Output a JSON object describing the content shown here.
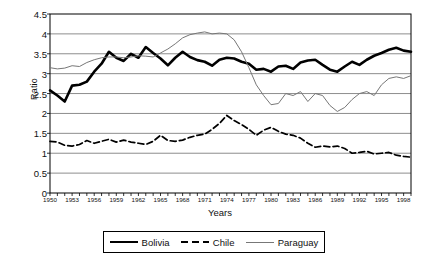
{
  "chart_data": {
    "type": "line",
    "title": "",
    "xlabel": "Years",
    "ylabel": "Ratio",
    "ylim": [
      0,
      4.5
    ],
    "xlim": [
      1950,
      1999
    ],
    "grid": true,
    "legend_position": "bottom",
    "y_ticks": [
      0,
      0.5,
      1,
      1.5,
      2,
      2.5,
      3,
      3.5,
      4,
      4.5
    ],
    "y_tick_labels": [
      "0",
      "0.5",
      "1",
      "1.5",
      "2",
      "2.5",
      "3",
      "3.5",
      "4",
      "4.5"
    ],
    "x_tick_labels": [
      "1950",
      "1953",
      "1956",
      "1959",
      "1962",
      "1965",
      "1968",
      "1971",
      "1974",
      "1977",
      "1980",
      "1983",
      "1986",
      "1989",
      "1992",
      "1995",
      "1998"
    ],
    "x": [
      1950,
      1951,
      1952,
      1953,
      1954,
      1955,
      1956,
      1957,
      1958,
      1959,
      1960,
      1961,
      1962,
      1963,
      1964,
      1965,
      1966,
      1967,
      1968,
      1969,
      1970,
      1971,
      1972,
      1973,
      1974,
      1975,
      1976,
      1977,
      1978,
      1979,
      1980,
      1981,
      1982,
      1983,
      1984,
      1985,
      1986,
      1987,
      1988,
      1989,
      1990,
      1991,
      1992,
      1993,
      1994,
      1995,
      1996,
      1997,
      1998,
      1999
    ],
    "series": [
      {
        "name": "Bolivia",
        "style": "thick-solid",
        "color": "#000000",
        "values": [
          2.58,
          2.45,
          2.3,
          2.7,
          2.72,
          2.8,
          3.05,
          3.25,
          3.55,
          3.4,
          3.32,
          3.5,
          3.4,
          3.67,
          3.52,
          3.38,
          3.21,
          3.4,
          3.55,
          3.42,
          3.34,
          3.3,
          3.2,
          3.35,
          3.4,
          3.38,
          3.3,
          3.25,
          3.1,
          3.12,
          3.05,
          3.18,
          3.2,
          3.12,
          3.28,
          3.33,
          3.35,
          3.22,
          3.1,
          3.05,
          3.18,
          3.3,
          3.22,
          3.35,
          3.45,
          3.52,
          3.6,
          3.65,
          3.58,
          3.55
        ]
      },
      {
        "name": "Chile",
        "style": "dashed",
        "color": "#000000",
        "values": [
          1.3,
          1.28,
          1.2,
          1.18,
          1.22,
          1.32,
          1.25,
          1.3,
          1.35,
          1.28,
          1.33,
          1.28,
          1.25,
          1.22,
          1.3,
          1.45,
          1.32,
          1.3,
          1.33,
          1.4,
          1.45,
          1.48,
          1.6,
          1.75,
          1.95,
          1.82,
          1.72,
          1.6,
          1.45,
          1.58,
          1.65,
          1.55,
          1.48,
          1.45,
          1.38,
          1.25,
          1.15,
          1.18,
          1.16,
          1.18,
          1.12,
          1.0,
          1.02,
          1.05,
          0.98,
          1.0,
          1.02,
          0.95,
          0.92,
          0.9
        ]
      },
      {
        "name": "Paraguay",
        "style": "thin-solid",
        "color": "#777777",
        "values": [
          3.15,
          3.12,
          3.14,
          3.2,
          3.18,
          3.28,
          3.35,
          3.4,
          3.42,
          3.42,
          3.4,
          3.42,
          3.45,
          3.44,
          3.42,
          3.52,
          3.62,
          3.75,
          3.9,
          3.98,
          4.02,
          4.05,
          4.0,
          4.02,
          4.0,
          3.85,
          3.55,
          3.15,
          2.72,
          2.45,
          2.22,
          2.25,
          2.5,
          2.45,
          2.55,
          2.3,
          2.5,
          2.45,
          2.2,
          2.05,
          2.15,
          2.35,
          2.5,
          2.55,
          2.45,
          2.72,
          2.88,
          2.92,
          2.88,
          2.95
        ]
      }
    ]
  },
  "legend": {
    "items": [
      {
        "label": "Bolivia",
        "swatch": "thick-solid-swatch"
      },
      {
        "label": "Chile",
        "swatch": "dashed-swatch"
      },
      {
        "label": "Paraguay",
        "swatch": "thin-solid-swatch"
      }
    ]
  }
}
